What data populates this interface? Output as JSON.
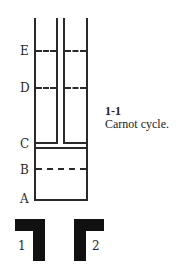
{
  "figure": {
    "number": "1-1",
    "caption": "Carnot cycle."
  },
  "diagram": {
    "positions": [
      {
        "label": "E",
        "style": "dashed"
      },
      {
        "label": "D",
        "style": "dashed"
      },
      {
        "label": "C",
        "style": "piston"
      },
      {
        "label": "B",
        "style": "dashed"
      },
      {
        "label": "A",
        "style": "bottom"
      }
    ],
    "reservoirs": [
      {
        "label": "1"
      },
      {
        "label": "2"
      }
    ],
    "line_color": "#2a2a2a",
    "reservoir_color": "#111111"
  }
}
